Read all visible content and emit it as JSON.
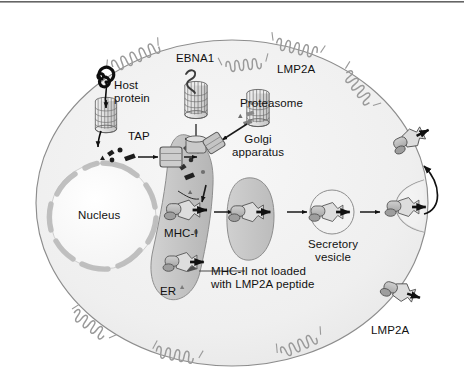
{
  "figure": {
    "type": "cell-biology-diagram"
  },
  "colors": {
    "top_rule": "#4a4a4a",
    "cytoplasm": "#f0f0f0",
    "cytoplasm_edge": "#8d8d8d",
    "nucleus_fill": "#fbfbfb",
    "nucleus_envelope": "#c9c9c9",
    "er_fill": "#c3c3c3",
    "golgi_fill": "#c6c6c6",
    "vesicle_fill": "#efefef",
    "proteasome_fill": "#e2e2e2",
    "proteasome_line": "#5d5d5d",
    "mhc_fill": "#b9b9b9",
    "peptide_dark": "#1a1a1a",
    "label_text": "#111111",
    "membrane_helix": "#9a9a9a"
  },
  "labels": {
    "host_protein": "Host\nprotein",
    "ebna1": "EBNA1",
    "lmp2a_top": "LMP2A",
    "proteasome": "Proteasome",
    "golgi": "Golgi\napparatus",
    "tap": "TAP",
    "nucleus": "Nucleus",
    "mhc_i": "MHC-I",
    "er": "ER",
    "mhc_ii_note": "MHC-II not loaded\nwith LMP2A peptide",
    "secretory_vesicle": "Secretory\nvesicle",
    "lmp2a_bottom": "LMP2A"
  },
  "structures": {
    "proteasomes": [
      {
        "name": "host-protein-proteasome",
        "note": "degrades host protein"
      },
      {
        "name": "ebna1-proteasome",
        "note": "EBNA1 resists degradation"
      },
      {
        "name": "lmp2a-proteasome",
        "note": "degrades LMP2A"
      }
    ],
    "membrane_proteins": [
      {
        "name": "lmp2a-membrane-helix",
        "count": 6
      }
    ],
    "mhc_complexes": [
      {
        "name": "mhc-i-in-er",
        "location": "ER"
      },
      {
        "name": "mhc-ii-unloaded",
        "location": "ER"
      },
      {
        "name": "mhc-i-golgi",
        "location": "Golgi apparatus"
      },
      {
        "name": "mhc-i-vesicle",
        "location": "Secretory vesicle"
      },
      {
        "name": "mhc-i-fusing-vesicle",
        "location": "plasma membrane"
      },
      {
        "name": "mhc-i-surface-upper",
        "location": "cell surface"
      },
      {
        "name": "mhc-i-surface-lower",
        "location": "cell surface"
      }
    ],
    "transporters": [
      {
        "name": "tap-transporter",
        "note": "peptide transport into ER"
      }
    ]
  },
  "flow": {
    "steps": [
      "Host protein degraded by proteasome into peptides",
      "Peptides transported into ER via TAP",
      "Peptides loaded onto MHC-I in ER",
      "MHC-I traffics through Golgi apparatus",
      "MHC-I carried in secretory vesicle",
      "Vesicle fuses with plasma membrane, MHC-I displayed at cell surface"
    ],
    "inhibition": "EBNA1 blocks its own proteasomal degradation"
  }
}
